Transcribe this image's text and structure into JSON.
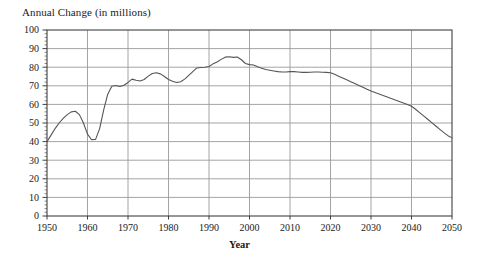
{
  "chart_data": {
    "type": "line",
    "title": "Annual Change (in millions)",
    "xlabel": "Year",
    "ylabel": "",
    "xlim": [
      1950,
      2050
    ],
    "ylim": [
      0,
      100
    ],
    "grid": true,
    "legend": null,
    "legend_position": "none",
    "xticks": [
      "1950",
      "1960",
      "1970",
      "1980",
      "1990",
      "2000",
      "2010",
      "2020",
      "2030",
      "2040",
      "2050"
    ],
    "yticks": [
      "0",
      "10",
      "20",
      "30",
      "40",
      "50",
      "60",
      "70",
      "80",
      "90",
      "100"
    ],
    "xtick_values": [
      1950,
      1960,
      1970,
      1980,
      1990,
      2000,
      2010,
      2020,
      2030,
      2040,
      2050
    ],
    "ytick_values": [
      0,
      10,
      20,
      30,
      40,
      50,
      60,
      70,
      80,
      90,
      100
    ],
    "series": [
      {
        "name": "Annual Change",
        "color": "#555555",
        "x": [
          1950,
          1951,
          1952,
          1953,
          1954,
          1955,
          1956,
          1957,
          1958,
          1959,
          1960,
          1961,
          1962,
          1963,
          1964,
          1965,
          1966,
          1967,
          1968,
          1969,
          1970,
          1971,
          1972,
          1973,
          1974,
          1975,
          1976,
          1977,
          1978,
          1979,
          1980,
          1981,
          1982,
          1983,
          1984,
          1985,
          1986,
          1987,
          1988,
          1989,
          1990,
          1991,
          1992,
          1993,
          1994,
          1995,
          1996,
          1997,
          1998,
          1999,
          2000,
          2001,
          2002,
          2003,
          2004,
          2005,
          2006,
          2007,
          2008,
          2009,
          2010,
          2011,
          2012,
          2013,
          2014,
          2015,
          2016,
          2017,
          2018,
          2019,
          2020,
          2021,
          2022,
          2023,
          2024,
          2025,
          2026,
          2027,
          2028,
          2029,
          2030,
          2031,
          2032,
          2033,
          2034,
          2035,
          2036,
          2037,
          2038,
          2039,
          2040,
          2041,
          2042,
          2043,
          2044,
          2045,
          2046,
          2047,
          2048,
          2049,
          2050
        ],
        "values": [
          40.0,
          43.5,
          47.0,
          50.0,
          52.5,
          54.5,
          56.0,
          56.3,
          54.5,
          50.0,
          44.0,
          41.0,
          41.2,
          47.0,
          57.0,
          65.5,
          69.8,
          70.2,
          69.6,
          70.3,
          71.8,
          73.6,
          73.0,
          72.6,
          73.4,
          75.2,
          76.6,
          77.0,
          76.4,
          75.0,
          73.4,
          72.4,
          71.8,
          72.2,
          73.6,
          75.6,
          77.6,
          79.6,
          79.8,
          80.0,
          80.4,
          81.8,
          82.8,
          84.2,
          85.4,
          85.6,
          85.3,
          85.5,
          84.0,
          82.0,
          81.4,
          81.2,
          80.2,
          79.4,
          78.8,
          78.4,
          78.0,
          77.6,
          77.4,
          77.4,
          77.6,
          77.6,
          77.4,
          77.2,
          77.2,
          77.3,
          77.4,
          77.4,
          77.3,
          77.2,
          77.0,
          76.2,
          75.2,
          74.2,
          73.2,
          72.2,
          71.2,
          70.2,
          69.2,
          68.2,
          67.2,
          66.4,
          65.6,
          64.8,
          64.0,
          63.2,
          62.4,
          61.6,
          60.8,
          60.0,
          59.0,
          57.4,
          55.6,
          53.8,
          52.0,
          50.2,
          48.4,
          46.6,
          44.8,
          43.2,
          42.0
        ]
      }
    ],
    "annotations": []
  },
  "style": {
    "background_color": "#ffffff",
    "grid_color": "#9a9a9a",
    "axis_color": "#404040",
    "line_color": "#555555",
    "text_color": "#1a1a1a"
  }
}
